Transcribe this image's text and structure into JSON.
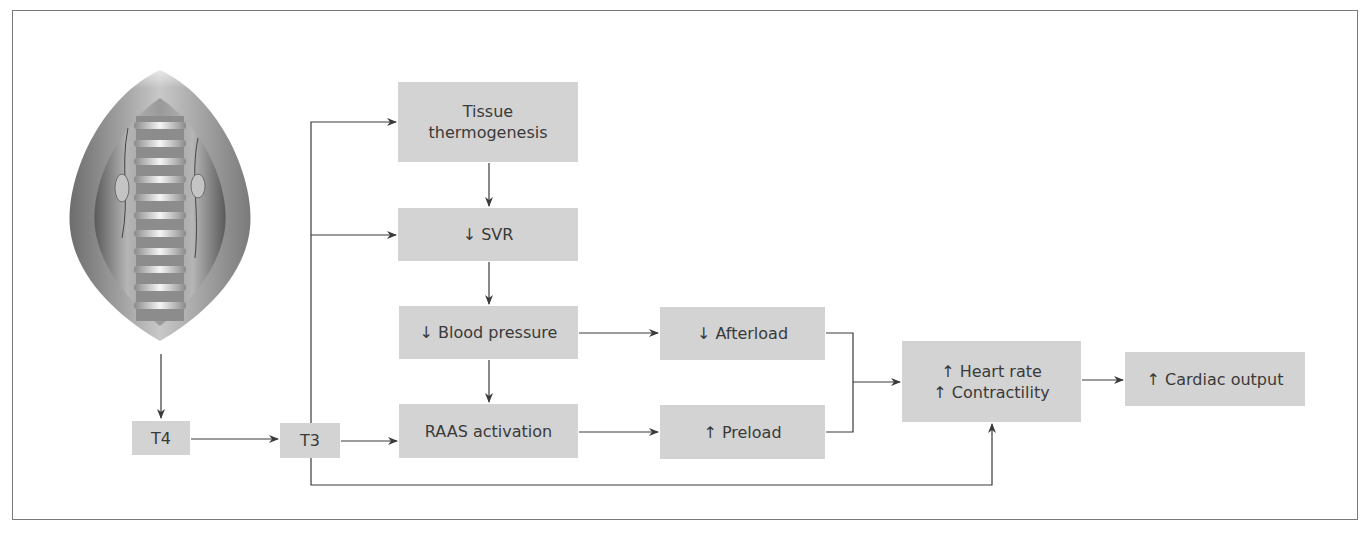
{
  "diagram": {
    "illustration": "spine-surgical-exposure-illustration",
    "nodes": {
      "t4": {
        "label": "T4"
      },
      "t3": {
        "label": "T3"
      },
      "tissue": {
        "line1": "Tissue",
        "line2": "thermogenesis"
      },
      "svr": {
        "label": "↓ SVR"
      },
      "bp": {
        "label": "↓ Blood pressure"
      },
      "raas": {
        "label": "RAAS activation"
      },
      "afterload": {
        "label": "↓ Afterload"
      },
      "preload": {
        "label": "↑ Preload"
      },
      "hr": {
        "line1": "↑ Heart rate",
        "line2": "↑ Contractility"
      },
      "co": {
        "label": "↑ Cardiac output"
      }
    },
    "edges": [
      [
        "illustration",
        "T4"
      ],
      [
        "T4",
        "T3"
      ],
      [
        "T3",
        "Tissue thermogenesis"
      ],
      [
        "T3",
        "↓ SVR"
      ],
      [
        "T3",
        "RAAS activation"
      ],
      [
        "T3",
        "↑ Heart rate / ↑ Contractility"
      ],
      [
        "Tissue thermogenesis",
        "↓ SVR"
      ],
      [
        "↓ SVR",
        "↓ Blood pressure"
      ],
      [
        "↓ Blood pressure",
        "RAAS activation"
      ],
      [
        "↓ Blood pressure",
        "↓ Afterload"
      ],
      [
        "RAAS activation",
        "↑ Preload"
      ],
      [
        "↓ Afterload",
        "↑ Heart rate / ↑ Contractility"
      ],
      [
        "↑ Preload",
        "↑ Heart rate / ↑ Contractility"
      ],
      [
        "↑ Heart rate / ↑ Contractility",
        "↑ Cardiac output"
      ]
    ],
    "colors": {
      "box_fill": "#d3d3d3",
      "line": "#3a3a3a",
      "border": "#7a7a7a"
    }
  }
}
